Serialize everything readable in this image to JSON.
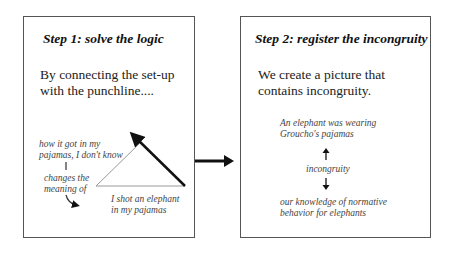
{
  "step1": {
    "title": "Step 1:  solve the logic",
    "body_line1": "By connecting the set-up",
    "body_line2": "with the punchline....",
    "note_top_line1": "how it got in my",
    "note_top_line2": "pajamas, I don't know",
    "note_mid_line1": "changes the",
    "note_mid_line2": "meaning of",
    "note_bottom_line1": "I shot an elephant",
    "note_bottom_line2": "in my pajamas"
  },
  "step2": {
    "title": "Step 2:  register the incongruity",
    "body_line1": "We create a picture that",
    "body_line2": "contains incongruity.",
    "top_line1": "An elephant was wearing",
    "top_line2": "Groucho's pajamas",
    "middle": "incongruity",
    "bottom_line1": "our knowledge of normative",
    "bottom_line2": "behavior for elephants"
  },
  "colors": {
    "border": "#555555",
    "arrow": "#111111",
    "triangle": "#999999"
  }
}
